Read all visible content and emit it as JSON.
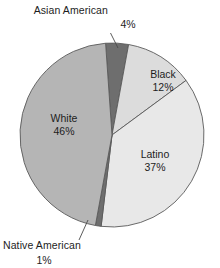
{
  "chart_data": {
    "type": "pie",
    "title": "",
    "subtitle": "",
    "xlabel": "",
    "ylabel": "",
    "legend_position": "none",
    "grid": false,
    "labels_show_percent": true,
    "categories": [
      "Asian American",
      "Black",
      "Latino",
      "Native American",
      "White"
    ],
    "values": [
      4,
      12,
      37,
      1,
      46
    ],
    "units": "%",
    "slices": [
      {
        "name": "Asian American",
        "label": "Asian American",
        "percent_text": "4%",
        "value": 4,
        "color": "#6e6e6e",
        "label_placement": "outside",
        "has_leader_line": true
      },
      {
        "name": "Black",
        "label": "Black",
        "percent_text": "12%",
        "value": 12,
        "color": "#dcdcdc",
        "label_placement": "inside",
        "has_leader_line": false
      },
      {
        "name": "Latino",
        "label": "Latino",
        "percent_text": "37%",
        "value": 37,
        "color": "#e8e8e8",
        "label_placement": "inside",
        "has_leader_line": false
      },
      {
        "name": "Native American",
        "label": "Native American",
        "percent_text": "1%",
        "value": 1,
        "color": "#6e6e6e",
        "label_placement": "outside",
        "has_leader_line": true
      },
      {
        "name": "White",
        "label": "White",
        "percent_text": "46%",
        "value": 46,
        "color": "#b5b5b5",
        "label_placement": "inside",
        "has_leader_line": false
      }
    ],
    "colors": {
      "asian_american": "#6e6e6e",
      "black": "#dcdcdc",
      "latino": "#e8e8e8",
      "native_american": "#6e6e6e",
      "white": "#b5b5b5",
      "outline": "#5a5a5a",
      "background": "#ffffff",
      "text": "#1d1d1d"
    }
  }
}
